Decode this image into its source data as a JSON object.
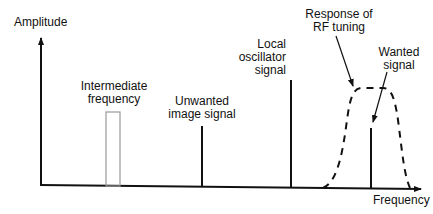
{
  "axes": {
    "y_label": "Amplitude",
    "x_label": "Frequency"
  },
  "labels": {
    "intermediate_frequency": [
      "Intermediate",
      "frequency"
    ],
    "unwanted_image": [
      "Unwanted",
      "image signal"
    ],
    "local_oscillator": [
      "Local",
      "oscillator",
      "signal"
    ],
    "rf_tuning": [
      "Response of",
      "RF tuning"
    ],
    "wanted_signal": [
      "Wanted",
      "signal"
    ]
  },
  "colors": {
    "line": "#111111",
    "if_box": "#999999",
    "background": "#ffffff"
  }
}
